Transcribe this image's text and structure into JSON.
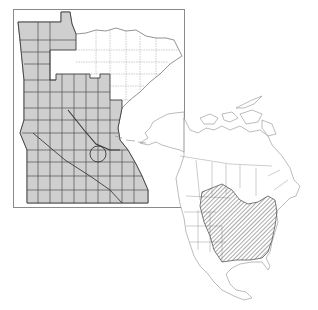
{
  "figure": {
    "type": "species-distribution-map",
    "panels": [
      {
        "id": "minnesota",
        "label": "Minnesota county distribution",
        "fill": "shaded counties = present"
      },
      {
        "id": "north-america",
        "label": "North American range",
        "fill": "hatched = range"
      }
    ]
  },
  "colors": {
    "background": "#ffffff",
    "frame": "#8a8a8a",
    "county_fill": "#cfcfcf",
    "county_line": "#3a3a3a",
    "unshaded_county_line": "#9a9a9a",
    "map_outline": "#8f8f8f",
    "hatch": "#555555"
  }
}
